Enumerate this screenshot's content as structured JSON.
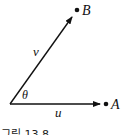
{
  "diagram": {
    "labels": {
      "point_b": "B",
      "point_a": "A",
      "vector_v": "v",
      "vector_u": "u",
      "angle": "θ"
    },
    "caption": "그림 13.8",
    "colors": {
      "stroke": "#111111",
      "background": "#ffffff"
    }
  }
}
